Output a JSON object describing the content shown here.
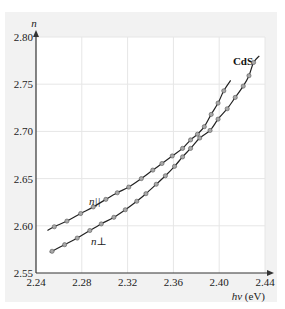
{
  "chart_data": {
    "type": "line",
    "title": "CdS",
    "xlabel": "hν (eV)",
    "ylabel": "n",
    "xlim": [
      2.24,
      2.44
    ],
    "ylim": [
      2.55,
      2.8
    ],
    "x_ticks": [
      "2.24",
      "2.28",
      "2.32",
      "2.36",
      "2.40",
      "2.44"
    ],
    "y_ticks": [
      "2.55",
      "2.60",
      "2.65",
      "2.70",
      "2.75",
      "2.80"
    ],
    "grid": true,
    "legend": "inline labels",
    "series": [
      {
        "name": "n∥",
        "label_display": "n||",
        "x": [
          2.256,
          2.267,
          2.279,
          2.29,
          2.301,
          2.311,
          2.321,
          2.332,
          2.342,
          2.35,
          2.359,
          2.368,
          2.375,
          2.381,
          2.387,
          2.393,
          2.399,
          2.404
        ],
        "y": [
          2.599,
          2.605,
          2.613,
          2.62,
          2.628,
          2.635,
          2.641,
          2.65,
          2.659,
          2.666,
          2.674,
          2.682,
          2.691,
          2.697,
          2.705,
          2.718,
          2.73,
          2.743
        ]
      },
      {
        "name": "n⊥",
        "label_display": "n⊥",
        "x": [
          2.254,
          2.265,
          2.276,
          2.287,
          2.297,
          2.308,
          2.318,
          2.328,
          2.336,
          2.345,
          2.353,
          2.361,
          2.368,
          2.375,
          2.383,
          2.392,
          2.399,
          2.407,
          2.414,
          2.421,
          2.426,
          2.43
        ],
        "y": [
          2.573,
          2.58,
          2.587,
          2.595,
          2.602,
          2.609,
          2.617,
          2.626,
          2.634,
          2.644,
          2.653,
          2.663,
          2.673,
          2.682,
          2.693,
          2.701,
          2.713,
          2.724,
          2.736,
          2.748,
          2.759,
          2.773
        ]
      }
    ]
  },
  "labels": {
    "title": "CdS",
    "y_axis": "n",
    "x_axis": "hν (eV)",
    "series_par": "n||",
    "series_perp": "n⊥"
  }
}
